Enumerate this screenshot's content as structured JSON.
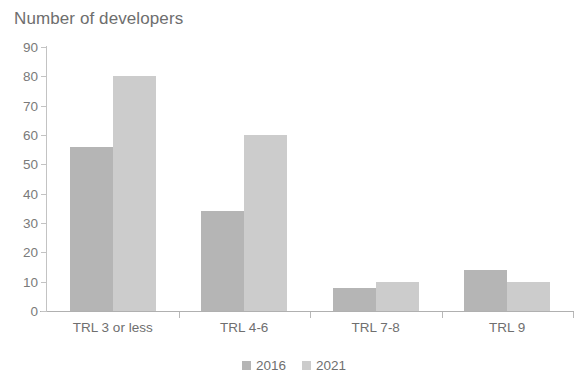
{
  "chart_data": {
    "type": "bar",
    "title": "Number of developers",
    "xlabel": "",
    "ylabel": "",
    "ylim": [
      0,
      90
    ],
    "yticks": [
      0,
      10,
      20,
      30,
      40,
      50,
      60,
      70,
      80,
      90
    ],
    "grid": false,
    "legend_position": "bottom-center",
    "categories": [
      "TRL 3 or less",
      "TRL 4-6",
      "TRL 7-8",
      "TRL 9"
    ],
    "series": [
      {
        "name": "2016",
        "color": "#b5b5b5",
        "values": [
          56,
          34,
          8,
          14
        ]
      },
      {
        "name": "2021",
        "color": "#cccccc",
        "values": [
          80,
          60,
          10,
          10
        ]
      }
    ]
  }
}
